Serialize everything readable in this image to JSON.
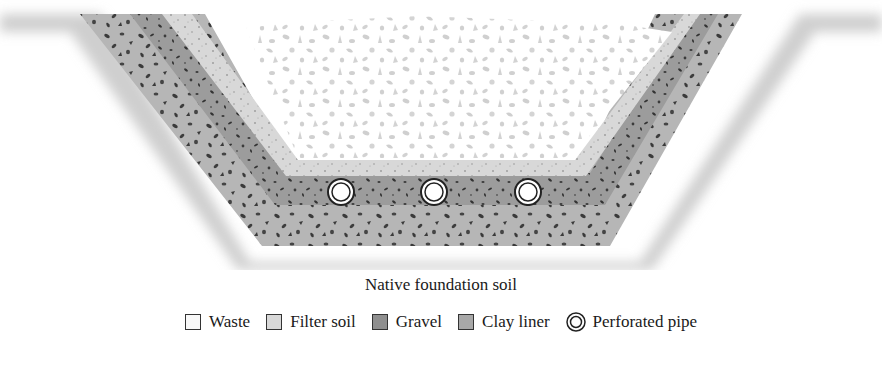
{
  "diagram": {
    "caption": "Native foundation soil",
    "layers": [
      {
        "id": "native",
        "name": "Native foundation soil",
        "color": "#d0d0d0"
      },
      {
        "id": "clay",
        "name": "Clay liner",
        "color": "#b4b4b4"
      },
      {
        "id": "gravel",
        "name": "Gravel",
        "color": "#9e9e9e"
      },
      {
        "id": "filter",
        "name": "Filter soil",
        "color": "#d6d6d6"
      },
      {
        "id": "waste",
        "name": "Waste",
        "color": "#ffffff"
      }
    ],
    "pipes": [
      {
        "cx": 341,
        "cy": 192,
        "r": 13
      },
      {
        "cx": 434,
        "cy": 192,
        "r": 13
      },
      {
        "cx": 528,
        "cy": 192,
        "r": 13
      }
    ]
  },
  "legend": {
    "items": [
      {
        "label": "Waste",
        "swatch": "#f8f8f8"
      },
      {
        "label": "Filter soil",
        "swatch": "#d8d8d8"
      },
      {
        "label": "Gravel",
        "swatch": "#8f8f8f"
      },
      {
        "label": "Clay liner",
        "swatch": "#a8a8a8"
      },
      {
        "label": "Perforated pipe",
        "swatch": "pipe"
      }
    ]
  }
}
